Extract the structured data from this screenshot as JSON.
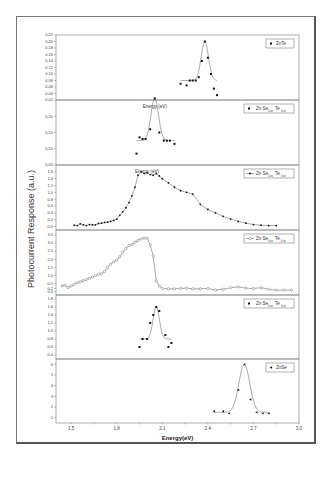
{
  "chart_data": {
    "type": "line",
    "title": "",
    "xlabel": "Energy(eV)",
    "ylabel": "Photocurrent Response (a.u.)",
    "xlim": [
      1.4,
      3.0
    ],
    "xticks": [
      "1.5",
      "1.8",
      "2.1",
      "2.4",
      "2.7",
      "3.0"
    ],
    "grid": false,
    "legend_position": "upper right of each panel",
    "layout": "6 vertically stacked panels sharing x-axis",
    "panels": [
      {
        "legend": "ZnTe",
        "marker": "square",
        "ylim": [
          0.02,
          0.22
        ],
        "yticks": [
          "0.02",
          "0.04",
          "0.06",
          "0.08",
          "0.10",
          "0.12",
          "0.14",
          "0.16",
          "0.18",
          "0.20",
          "0.22"
        ],
        "x": [
          2.22,
          2.26,
          2.28,
          2.3,
          2.32,
          2.34,
          2.36,
          2.38,
          2.4,
          2.42,
          2.44,
          2.46
        ],
        "values": [
          0.07,
          0.065,
          0.08,
          0.08,
          0.08,
          0.09,
          0.14,
          0.2,
          0.15,
          0.1,
          0.055,
          0.035
        ],
        "fit": "gaussian peak ~2.37 eV"
      },
      {
        "legend": "Zn Se0.xx Te0.xx",
        "marker": "square",
        "ylim": [
          0.05,
          0.25
        ],
        "yticks": [
          "0.05",
          "0.10",
          "0.15",
          "0.20"
        ],
        "annotation": "Energy (eV)",
        "x": [
          1.93,
          1.95,
          1.97,
          1.99,
          2.02,
          2.05,
          2.08,
          2.11,
          2.13,
          2.15,
          2.18
        ],
        "values": [
          0.085,
          0.135,
          0.13,
          0.13,
          0.16,
          0.255,
          0.15,
          0.125,
          0.125,
          0.125,
          0.115
        ],
        "fit": "gaussian peak ~2.05 eV"
      },
      {
        "legend": "Zn Se0.xx Te0.xx",
        "marker": "line-dot",
        "ylim": [
          -0.1,
          1.8
        ],
        "yticks": [
          "0.0",
          "0.2",
          "0.4",
          "0.6",
          "0.8",
          "1.0",
          "1.2",
          "1.4",
          "1.6"
        ],
        "annotation": "Energy (eV)",
        "x": [
          1.52,
          1.54,
          1.56,
          1.58,
          1.6,
          1.62,
          1.64,
          1.66,
          1.68,
          1.7,
          1.72,
          1.74,
          1.76,
          1.78,
          1.8,
          1.82,
          1.84,
          1.86,
          1.88,
          1.9,
          1.92,
          1.94,
          1.96,
          1.98,
          2.0,
          2.02,
          2.04,
          2.06,
          2.08,
          2.1,
          2.14,
          2.18,
          2.22,
          2.26,
          2.3,
          2.35,
          2.4,
          2.45,
          2.5,
          2.55,
          2.6,
          2.65,
          2.7,
          2.75,
          2.8,
          2.85
        ],
        "values": [
          0.04,
          0.03,
          0.08,
          0.05,
          0.03,
          0.06,
          0.05,
          0.05,
          0.09,
          0.1,
          0.12,
          0.13,
          0.15,
          0.18,
          0.22,
          0.33,
          0.43,
          0.55,
          0.7,
          0.9,
          1.15,
          1.5,
          1.6,
          1.55,
          1.58,
          1.52,
          1.5,
          1.55,
          1.48,
          1.4,
          1.28,
          1.15,
          1.05,
          1.0,
          0.95,
          0.65,
          0.5,
          0.4,
          0.3,
          0.22,
          0.15,
          0.1,
          0.06,
          0.04,
          0.03,
          0.03
        ],
        "fit": "connected line"
      },
      {
        "legend": "Zn Se0.xx Te0.xx",
        "marker": "open-diamond-line",
        "ylim": [
          -0.2,
          3.8
        ],
        "yticks": [
          "0.0",
          "0.2",
          "0.5",
          "1.0",
          "1.5",
          "2.0",
          "2.5",
          "3.0",
          "3.5"
        ],
        "x": [
          1.44,
          1.46,
          1.48,
          1.5,
          1.52,
          1.54,
          1.56,
          1.58,
          1.6,
          1.62,
          1.64,
          1.66,
          1.68,
          1.7,
          1.72,
          1.74,
          1.76,
          1.78,
          1.8,
          1.82,
          1.84,
          1.86,
          1.88,
          1.9,
          1.92,
          1.94,
          1.96,
          1.98,
          2.0,
          2.02,
          2.04,
          2.06,
          2.08,
          2.1,
          2.14,
          2.18,
          2.22,
          2.26,
          2.3,
          2.35,
          2.4,
          2.45,
          2.5,
          2.55,
          2.6,
          2.65,
          2.7,
          2.75,
          2.8,
          2.85,
          2.9,
          2.95
        ],
        "values": [
          0.35,
          0.4,
          0.25,
          0.35,
          0.45,
          0.55,
          0.62,
          0.68,
          0.75,
          0.82,
          0.9,
          1.0,
          1.08,
          1.12,
          1.25,
          1.5,
          1.7,
          1.85,
          1.95,
          2.15,
          2.45,
          2.65,
          2.85,
          2.9,
          3.05,
          3.15,
          3.25,
          3.3,
          3.3,
          2.9,
          2.2,
          0.65,
          0.35,
          0.2,
          0.18,
          0.18,
          0.2,
          0.22,
          0.18,
          0.18,
          0.2,
          0.1,
          0.15,
          0.25,
          0.3,
          0.22,
          0.2,
          0.25,
          0.15,
          0.1,
          0.1,
          0.1
        ],
        "fit": "connected line"
      },
      {
        "legend": "Zn Se0.xx Te0.xx",
        "marker": "square",
        "ylim": [
          0.3,
          1.9
        ],
        "yticks": [
          "0.4",
          "0.6",
          "0.8",
          "1.0",
          "1.2",
          "1.4",
          "1.6",
          "1.8"
        ],
        "x": [
          1.95,
          1.97,
          2.0,
          2.02,
          2.04,
          2.06,
          2.08,
          2.12,
          2.14,
          2.16
        ],
        "values": [
          0.6,
          0.8,
          0.8,
          1.2,
          1.4,
          1.6,
          1.5,
          0.9,
          0.6,
          0.7
        ],
        "fit": "gaussian peak ~2.06 eV"
      },
      {
        "legend": "ZnSe",
        "marker": "left-triangle",
        "ylim": [
          0.5,
          6.5
        ],
        "yticks": [
          "1",
          "2",
          "3",
          "4",
          "5",
          "6"
        ],
        "x": [
          2.44,
          2.5,
          2.54,
          2.6,
          2.64,
          2.68,
          2.72,
          2.76,
          2.8
        ],
        "values": [
          1.6,
          1.6,
          1.4,
          3.6,
          6.0,
          2.7,
          1.5,
          1.4,
          1.4
        ],
        "fit": "gaussian peak ~2.58 eV"
      }
    ]
  },
  "labels": {
    "ylabel": "Photocurrent Response (a.u.)",
    "xlabel": "Energy(eV)",
    "ann2": "Energy (eV)",
    "ann3": "Energy (eV)",
    "leg1": "ZnTe",
    "leg2_a": "Zn Se",
    "leg2_b": "Te",
    "leg6": "ZnSe"
  }
}
